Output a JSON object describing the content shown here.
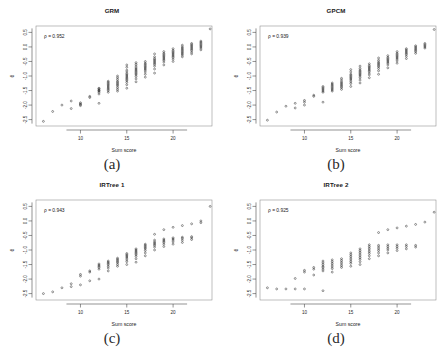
{
  "figure": {
    "panel_letters": [
      "(a)",
      "(b)",
      "(c)",
      "(d)"
    ]
  },
  "chart_data": [
    {
      "type": "scatter",
      "title": "GRM",
      "panel": "(a)",
      "xlabel": "Sum score",
      "ylabel": "θ",
      "annotation": "ρ = 0.952",
      "rho": 0.952,
      "xlim": [
        5.2,
        24.2
      ],
      "ylim": [
        -2.72,
        0.72
      ],
      "xticks": [
        10,
        15,
        20
      ],
      "xticklabels": [
        "10",
        "15",
        "20"
      ],
      "yticks": [
        -2.5,
        -2.0,
        -1.5,
        -1.0,
        -0.5,
        0.0,
        0.5
      ],
      "yticklabels": [
        "-2.5",
        "-2.0",
        "-1.5",
        "-1.0",
        "-0.5",
        "0.0",
        "0.5"
      ],
      "grid": false,
      "legend": "none",
      "marker": "open-circle",
      "columns": [
        {
          "x": 6,
          "values": [
            -2.56
          ]
        },
        {
          "x": 7,
          "values": [
            -2.22
          ]
        },
        {
          "x": 8,
          "values": [
            -2.0
          ]
        },
        {
          "x": 9,
          "values": [
            -2.12,
            -1.86
          ]
        },
        {
          "x": 10,
          "values": [
            -2.02,
            -1.96,
            -1.92,
            -1.98
          ]
        },
        {
          "x": 11,
          "values": [
            -1.74,
            -1.7
          ]
        },
        {
          "x": 12,
          "values": [
            -1.94,
            -1.62,
            -1.56,
            -1.52,
            -1.5,
            -1.48,
            -1.44,
            -1.42
          ]
        },
        {
          "x": 13,
          "values": [
            -1.56,
            -1.5,
            -1.46,
            -1.42,
            -1.38,
            -1.34,
            -1.3,
            -1.26,
            -1.22,
            -1.18
          ]
        },
        {
          "x": 14,
          "values": [
            -1.52,
            -1.46,
            -1.4,
            -1.34,
            -1.3,
            -1.26,
            -1.22,
            -1.18,
            -1.12,
            -1.06,
            -1.0
          ]
        },
        {
          "x": 15,
          "values": [
            -1.42,
            -1.3,
            -1.22,
            -1.16,
            -1.12,
            -1.08,
            -1.04,
            -1.0,
            -0.96,
            -0.92,
            -0.86,
            -0.8,
            -0.7,
            -0.62
          ]
        },
        {
          "x": 16,
          "values": [
            -1.2,
            -1.1,
            -1.02,
            -0.96,
            -0.92,
            -0.88,
            -0.84,
            -0.8,
            -0.76,
            -0.72,
            -0.66,
            -0.6,
            -0.54
          ]
        },
        {
          "x": 17,
          "values": [
            -1.04,
            -0.94,
            -0.86,
            -0.8,
            -0.76,
            -0.72,
            -0.68,
            -0.64,
            -0.6,
            -0.56,
            -0.5
          ]
        },
        {
          "x": 18,
          "values": [
            -0.9,
            -0.76,
            -0.66,
            -0.6,
            -0.56,
            -0.52,
            -0.48,
            -0.44,
            -0.4,
            -0.34,
            -0.24
          ]
        },
        {
          "x": 19,
          "values": [
            -0.62,
            -0.52,
            -0.46,
            -0.42,
            -0.38,
            -0.34,
            -0.3,
            -0.26,
            -0.22,
            -0.16
          ]
        },
        {
          "x": 20,
          "values": [
            -0.5,
            -0.42,
            -0.36,
            -0.32,
            -0.28,
            -0.24,
            -0.2,
            -0.16,
            -0.12,
            -0.06
          ]
        },
        {
          "x": 21,
          "values": [
            -0.34,
            -0.28,
            -0.24,
            -0.2,
            -0.16,
            -0.12,
            -0.08,
            -0.04,
            0.0,
            0.06
          ]
        },
        {
          "x": 22,
          "values": [
            -0.24,
            -0.18,
            -0.12,
            -0.08,
            -0.04,
            0.0,
            0.04,
            0.08,
            0.12
          ]
        },
        {
          "x": 23,
          "values": [
            -0.1,
            -0.04,
            0.0,
            0.04,
            0.08,
            0.12,
            0.16,
            0.2
          ]
        },
        {
          "x": 24,
          "values": [
            0.62
          ]
        }
      ]
    },
    {
      "type": "scatter",
      "title": "GPCM",
      "panel": "(b)",
      "xlabel": "Sum score",
      "ylabel": "θ",
      "annotation": "ρ = 0.939",
      "rho": 0.939,
      "xlim": [
        5.2,
        24.2
      ],
      "ylim": [
        -2.72,
        0.72
      ],
      "xticks": [
        10,
        15,
        20
      ],
      "xticklabels": [
        "10",
        "15",
        "20"
      ],
      "yticks": [
        -2.5,
        -2.0,
        -1.5,
        -1.0,
        -0.5,
        0.0,
        0.5
      ],
      "yticklabels": [
        "-2.5",
        "-2.0",
        "-1.5",
        "-1.0",
        "-0.5",
        "0.0",
        "0.5"
      ],
      "grid": false,
      "legend": "none",
      "marker": "open-circle",
      "columns": [
        {
          "x": 6,
          "values": [
            -2.52
          ]
        },
        {
          "x": 7,
          "values": [
            -2.24
          ]
        },
        {
          "x": 8,
          "values": [
            -2.04
          ]
        },
        {
          "x": 9,
          "values": [
            -2.1,
            -1.94
          ]
        },
        {
          "x": 10,
          "values": [
            -2.0,
            -1.9,
            -1.84
          ]
        },
        {
          "x": 11,
          "values": [
            -1.7,
            -1.66
          ]
        },
        {
          "x": 12,
          "values": [
            -1.9,
            -1.56,
            -1.52,
            -1.48,
            -1.44,
            -1.4,
            -1.36
          ]
        },
        {
          "x": 13,
          "values": [
            -1.52,
            -1.48,
            -1.44,
            -1.4,
            -1.36,
            -1.32,
            -1.28,
            -1.24
          ]
        },
        {
          "x": 14,
          "values": [
            -1.46,
            -1.4,
            -1.36,
            -1.32,
            -1.28,
            -1.24,
            -1.2,
            -1.14,
            -1.08
          ]
        },
        {
          "x": 15,
          "values": [
            -1.36,
            -1.26,
            -1.2,
            -1.14,
            -1.1,
            -1.06,
            -1.02,
            -0.98,
            -0.94,
            -0.86,
            -0.78
          ]
        },
        {
          "x": 16,
          "values": [
            -1.24,
            -1.14,
            -1.06,
            -1.0,
            -0.96,
            -0.92,
            -0.88,
            -0.84,
            -0.8,
            -0.74,
            -0.66
          ]
        },
        {
          "x": 17,
          "values": [
            -1.06,
            -0.96,
            -0.9,
            -0.84,
            -0.8,
            -0.76,
            -0.72,
            -0.68,
            -0.64,
            -0.58
          ]
        },
        {
          "x": 18,
          "values": [
            -0.94,
            -0.82,
            -0.74,
            -0.68,
            -0.64,
            -0.6,
            -0.56,
            -0.52,
            -0.46,
            -0.38
          ]
        },
        {
          "x": 19,
          "values": [
            -0.72,
            -0.62,
            -0.56,
            -0.52,
            -0.48,
            -0.44,
            -0.4,
            -0.36,
            -0.3
          ]
        },
        {
          "x": 20,
          "values": [
            -0.56,
            -0.48,
            -0.42,
            -0.38,
            -0.34,
            -0.3,
            -0.26,
            -0.22,
            -0.16
          ]
        },
        {
          "x": 21,
          "values": [
            -0.4,
            -0.32,
            -0.26,
            -0.22,
            -0.18,
            -0.14,
            -0.1,
            -0.06
          ]
        },
        {
          "x": 22,
          "values": [
            -0.22,
            -0.16,
            -0.12,
            -0.08,
            -0.04,
            0.0,
            0.04
          ]
        },
        {
          "x": 23,
          "values": [
            -0.04,
            0.0,
            0.04,
            0.08,
            0.12
          ]
        },
        {
          "x": 24,
          "values": [
            0.6
          ]
        }
      ]
    },
    {
      "type": "scatter",
      "title": "IRTree 1",
      "panel": "(c)",
      "xlabel": "Sum score",
      "ylabel": "θ",
      "annotation": "ρ = 0.943",
      "rho": 0.943,
      "xlim": [
        5.2,
        24.2
      ],
      "ylim": [
        -2.72,
        0.72
      ],
      "xticks": [
        10,
        15,
        20
      ],
      "xticklabels": [
        "10",
        "15",
        "20"
      ],
      "yticks": [
        -2.5,
        -2.0,
        -1.5,
        -1.0,
        -0.5,
        0.0,
        0.5
      ],
      "yticklabels": [
        "-2.5",
        "-2.0",
        "-1.5",
        "-1.0",
        "-0.5",
        "0.0",
        "0.5"
      ],
      "grid": false,
      "legend": "none",
      "marker": "open-circle",
      "columns": [
        {
          "x": 6,
          "values": [
            -2.5
          ]
        },
        {
          "x": 7,
          "values": [
            -2.44
          ]
        },
        {
          "x": 8,
          "values": [
            -2.3
          ]
        },
        {
          "x": 9,
          "values": [
            -2.26,
            -2.16
          ]
        },
        {
          "x": 10,
          "values": [
            -2.2,
            -1.9,
            -1.84
          ]
        },
        {
          "x": 11,
          "values": [
            -2.06,
            -1.76,
            -1.72
          ]
        },
        {
          "x": 12,
          "values": [
            -2.0,
            -1.66,
            -1.6,
            -1.56,
            -1.52,
            -1.48
          ]
        },
        {
          "x": 13,
          "values": [
            -1.72,
            -1.62,
            -1.56,
            -1.5,
            -1.46,
            -1.42,
            -1.38
          ]
        },
        {
          "x": 14,
          "values": [
            -1.56,
            -1.5,
            -1.44,
            -1.4,
            -1.36,
            -1.32,
            -1.28
          ]
        },
        {
          "x": 15,
          "values": [
            -1.5,
            -1.4,
            -1.34,
            -1.28,
            -1.24,
            -1.2,
            -1.16,
            -1.12
          ]
        },
        {
          "x": 16,
          "values": [
            -1.42,
            -1.3,
            -1.22,
            -1.16,
            -1.12,
            -1.08,
            -1.04,
            -1.0,
            -0.96
          ]
        },
        {
          "x": 17,
          "values": [
            -1.2,
            -1.1,
            -1.02,
            -0.96,
            -0.92,
            -0.88,
            -0.84,
            -0.8
          ]
        },
        {
          "x": 18,
          "values": [
            -1.0,
            -0.9,
            -0.84,
            -0.8,
            -0.76,
            -0.72,
            -0.66,
            -0.46
          ]
        },
        {
          "x": 19,
          "values": [
            -0.88,
            -0.8,
            -0.74,
            -0.7,
            -0.66,
            -0.62,
            -0.3
          ]
        },
        {
          "x": 20,
          "values": [
            -0.8,
            -0.72,
            -0.66,
            -0.62,
            -0.58,
            -0.22
          ]
        },
        {
          "x": 21,
          "values": [
            -0.74,
            -0.66,
            -0.6,
            -0.56,
            -0.16
          ]
        },
        {
          "x": 22,
          "values": [
            -0.64,
            -0.58,
            -0.54,
            -0.1
          ]
        },
        {
          "x": 23,
          "values": [
            -0.06,
            0.0
          ]
        },
        {
          "x": 24,
          "values": [
            0.5
          ]
        }
      ]
    },
    {
      "type": "scatter",
      "title": "IRTree 2",
      "panel": "(d)",
      "xlabel": "Sum score",
      "ylabel": "θ",
      "annotation": "ρ = 0.925",
      "rho": 0.925,
      "xlim": [
        5.2,
        24.2
      ],
      "ylim": [
        -2.72,
        0.72
      ],
      "xticks": [
        10,
        15,
        20
      ],
      "xticklabels": [
        "10",
        "15",
        "20"
      ],
      "yticks": [
        -2.5,
        -2.0,
        -1.5,
        -1.0,
        -0.5,
        0.0,
        0.5
      ],
      "yticklabels": [
        "-2.5",
        "-2.0",
        "-1.5",
        "-1.0",
        "-0.5",
        "0.0",
        "0.5"
      ],
      "grid": false,
      "legend": "none",
      "marker": "open-circle",
      "columns": [
        {
          "x": 6,
          "values": [
            -2.3
          ]
        },
        {
          "x": 7,
          "values": [
            -2.34
          ]
        },
        {
          "x": 8,
          "values": [
            -2.34
          ]
        },
        {
          "x": 9,
          "values": [
            -2.34,
            -1.98
          ]
        },
        {
          "x": 10,
          "values": [
            -2.34,
            -1.76,
            -1.7
          ]
        },
        {
          "x": 11,
          "values": [
            -1.86,
            -1.66,
            -1.6
          ]
        },
        {
          "x": 12,
          "values": [
            -2.4,
            -1.72,
            -1.66,
            -1.6,
            -1.56,
            -1.5,
            -1.44,
            -1.38
          ]
        },
        {
          "x": 13,
          "values": [
            -1.76,
            -1.64,
            -1.58,
            -1.52,
            -1.46,
            -1.4,
            -1.34
          ]
        },
        {
          "x": 14,
          "values": [
            -1.6,
            -1.54,
            -1.48,
            -1.42,
            -1.36,
            -1.3
          ]
        },
        {
          "x": 15,
          "values": [
            -1.56,
            -1.46,
            -1.4,
            -1.34,
            -1.28,
            -1.22,
            -1.16,
            -1.1
          ]
        },
        {
          "x": 16,
          "values": [
            -1.5,
            -1.4,
            -1.32,
            -1.26,
            -1.2,
            -1.14,
            -1.08,
            -1.02,
            -0.96
          ]
        },
        {
          "x": 17,
          "values": [
            -1.3,
            -1.2,
            -1.12,
            -1.06,
            -1.0,
            -0.94,
            -0.88,
            -0.82
          ]
        },
        {
          "x": 18,
          "values": [
            -1.2,
            -1.1,
            -1.02,
            -0.96,
            -0.9,
            -0.84,
            -0.4
          ]
        },
        {
          "x": 19,
          "values": [
            -1.1,
            -1.0,
            -0.94,
            -0.88,
            -0.82,
            -0.3
          ]
        },
        {
          "x": 20,
          "values": [
            -1.02,
            -0.94,
            -0.88,
            -0.82,
            -0.24
          ]
        },
        {
          "x": 21,
          "values": [
            -0.96,
            -0.88,
            -0.82,
            -0.18
          ]
        },
        {
          "x": 22,
          "values": [
            -0.9,
            -0.84,
            -0.12
          ]
        },
        {
          "x": 23,
          "values": [
            -0.04
          ]
        },
        {
          "x": 24,
          "values": [
            0.3
          ]
        }
      ]
    }
  ]
}
